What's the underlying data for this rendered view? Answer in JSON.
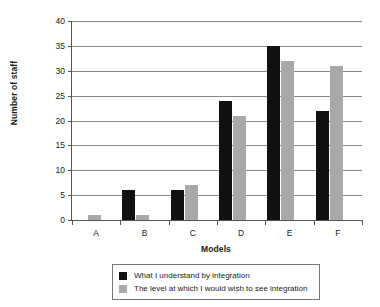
{
  "chart_data": {
    "type": "bar",
    "title": "",
    "xlabel": "Models",
    "ylabel": "Number of staff",
    "categories": [
      "A",
      "B",
      "C",
      "D",
      "E",
      "F"
    ],
    "ylim": [
      0,
      40
    ],
    "yticks": [
      0,
      5,
      10,
      15,
      20,
      25,
      30,
      35,
      40
    ],
    "ytick_labels": [
      "0",
      "5",
      "10",
      "15",
      "20",
      "25",
      "30",
      "35",
      "40"
    ],
    "grid": true,
    "legend_position": "bottom",
    "series": [
      {
        "name": "What I understand by integration",
        "color": "#111111",
        "values": [
          0,
          6,
          6,
          24,
          35,
          22
        ]
      },
      {
        "name": "The level at which I would wish to see integration",
        "color": "#a9a9a9",
        "values": [
          1,
          1,
          7,
          21,
          32,
          31
        ]
      }
    ]
  }
}
